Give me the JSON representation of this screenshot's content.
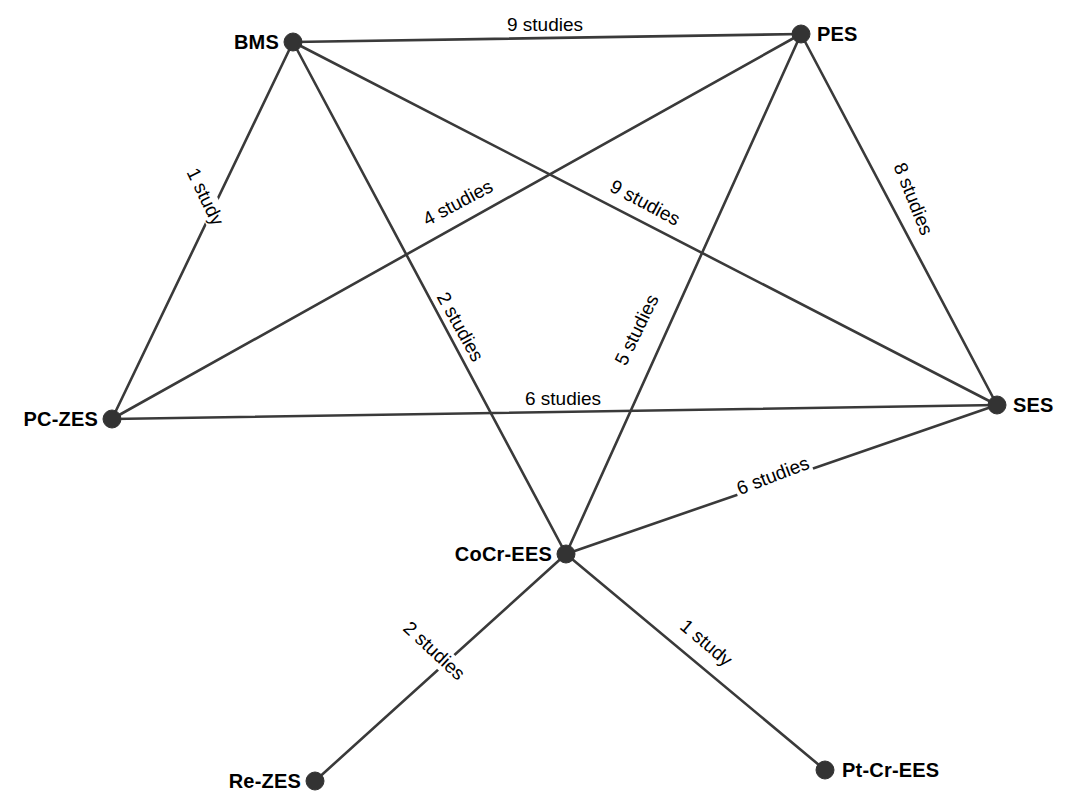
{
  "figure": {
    "type": "network-diagram",
    "background_color": "#ffffff",
    "node_color": "#333333",
    "edge_color": "#3a3a3a"
  },
  "chart_data": {
    "type": "network",
    "title": "",
    "xlabel": "",
    "ylabel": "",
    "nodes": [
      {
        "id": "BMS",
        "label": "BMS",
        "x": 293,
        "y": 42,
        "label_dx": -57,
        "label_dy": -11,
        "degree": 4
      },
      {
        "id": "PES",
        "label": "PES",
        "x": 801,
        "y": 34,
        "label_dx": 16,
        "label_dy": -11,
        "degree": 4
      },
      {
        "id": "PC-ZES",
        "label": "PC-ZES",
        "x": 112,
        "y": 419,
        "label_dx": -95,
        "label_dy": -11,
        "degree": 3
      },
      {
        "id": "SES",
        "label": "SES",
        "x": 997,
        "y": 405,
        "label_dx": 16,
        "label_dy": -11,
        "degree": 4
      },
      {
        "id": "CoCr-EES",
        "label": "CoCr-EES",
        "x": 566,
        "y": 554,
        "label_dx": -117,
        "label_dy": -11,
        "degree": 5
      },
      {
        "id": "Re-ZES",
        "label": "Re-ZES",
        "x": 315,
        "y": 781,
        "label_dx": -93,
        "label_dy": -11,
        "degree": 1
      },
      {
        "id": "Pt-Cr-EES",
        "label": "Pt-Cr-EES",
        "x": 825,
        "y": 770,
        "label_dx": 17,
        "label_dy": -11,
        "degree": 1
      }
    ],
    "edges": [
      {
        "source": "BMS",
        "target": "PES",
        "studies": 9,
        "label": "9 studies",
        "label_x": 545,
        "label_y": 25,
        "rotate": 0
      },
      {
        "source": "BMS",
        "target": "PC-ZES",
        "studies": 1,
        "label": "1 study",
        "label_x": 205,
        "label_y": 197,
        "rotate": 64
      },
      {
        "source": "BMS",
        "target": "SES",
        "studies": 9,
        "label": "9 studies",
        "label_x": 645,
        "label_y": 203,
        "rotate": 28
      },
      {
        "source": "BMS",
        "target": "CoCr-EES",
        "studies": 2,
        "label": "2 studies",
        "label_x": 460,
        "label_y": 327,
        "rotate": 61
      },
      {
        "source": "PES",
        "target": "PC-ZES",
        "studies": 4,
        "label": "4 studies",
        "label_x": 458,
        "label_y": 203,
        "rotate": -28
      },
      {
        "source": "PES",
        "target": "SES",
        "studies": 8,
        "label": "8 studies",
        "label_x": 913,
        "label_y": 199,
        "rotate": 68
      },
      {
        "source": "PES",
        "target": "CoCr-EES",
        "studies": 5,
        "label": "5 studies",
        "label_x": 637,
        "label_y": 330,
        "rotate": -64
      },
      {
        "source": "PC-ZES",
        "target": "SES",
        "studies": 6,
        "label": "6 studies",
        "label_x": 563,
        "label_y": 399,
        "rotate": 0
      },
      {
        "source": "CoCr-EES",
        "target": "SES",
        "studies": 6,
        "label": "6 studies",
        "label_x": 773,
        "label_y": 476,
        "rotate": -21
      },
      {
        "source": "CoCr-EES",
        "target": "Re-ZES",
        "studies": 2,
        "label": "2 studies",
        "label_x": 434,
        "label_y": 651,
        "rotate": 43
      },
      {
        "source": "CoCr-EES",
        "target": "Pt-Cr-EES",
        "studies": 1,
        "label": "1 study",
        "label_x": 706,
        "label_y": 643,
        "rotate": 40
      }
    ],
    "legend": [],
    "grid": false
  }
}
